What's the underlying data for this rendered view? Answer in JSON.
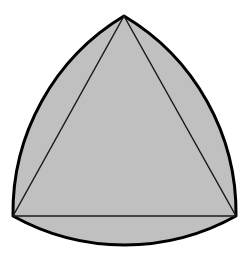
{
  "figure": {
    "name": "Reuleaux triangle with inscribed equilateral triangle",
    "canvas": {
      "width": 249,
      "height": 258
    },
    "background_color": "#ffffff",
    "fill_color": "#c0c0c0",
    "outline_color": "#000000",
    "chord_color": "#1a1a1a",
    "outline_width": 3,
    "chord_width": 1.5,
    "vertices": [
      {
        "name": "apex",
        "x": 124,
        "y": 16
      },
      {
        "name": "bottom-left",
        "x": 13,
        "y": 216
      },
      {
        "name": "bottom-right",
        "x": 236,
        "y": 216
      }
    ],
    "arc_radius": 229,
    "arc_extremes": [
      {
        "name": "bottom-arc-lowest",
        "x": 124,
        "y": 246
      },
      {
        "name": "left-arc-outermost",
        "x": 2,
        "y": 158
      },
      {
        "name": "right-arc-outermost",
        "x": 246,
        "y": 158
      }
    ],
    "outline_path": "M 124 16 A 229 229 0 0 1 236 216 A 229 229 0 0 1 13 216 A 229 229 0 0 1 124 16 Z",
    "chords": [
      {
        "name": "left-chord",
        "x1": 124,
        "y1": 16,
        "x2": 13,
        "y2": 216
      },
      {
        "name": "right-chord",
        "x1": 124,
        "y1": 16,
        "x2": 236,
        "y2": 216
      },
      {
        "name": "base-chord",
        "x1": 13,
        "y1": 216,
        "x2": 236,
        "y2": 216
      }
    ]
  }
}
